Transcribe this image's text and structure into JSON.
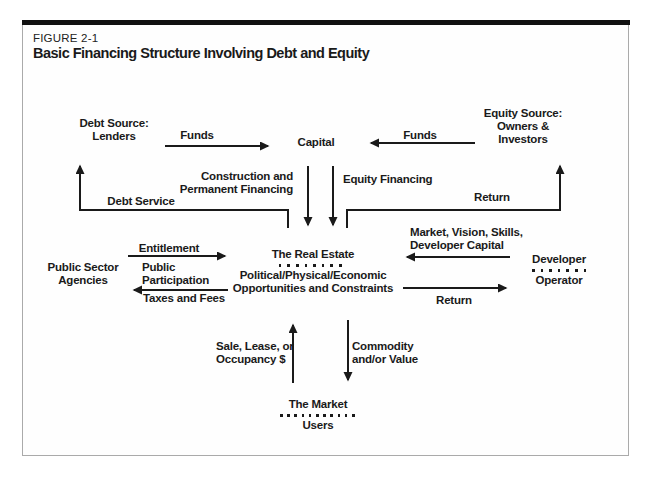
{
  "figure": {
    "label": "FIGURE 2-1",
    "title": "Basic Financing Structure Involving Debt and Equity"
  },
  "nodes": {
    "debt_source": {
      "line1": "Debt Source:",
      "line2": "Lenders"
    },
    "capital": {
      "label": "Capital"
    },
    "equity_source": {
      "line1": "Equity Source:",
      "line2": "Owners &",
      "line3": "Investors"
    },
    "real_estate": {
      "title": "The Real Estate",
      "sub1": "Political/Physical/Economic",
      "sub2": "Opportunities and Constraints"
    },
    "public_sector": {
      "line1": "Public Sector",
      "line2": "Agencies"
    },
    "developer_operator": {
      "line1": "Developer",
      "line2": "Operator"
    },
    "market": {
      "line1": "The Market",
      "line2": "Users"
    }
  },
  "flows": {
    "funds_left": {
      "label": "Funds"
    },
    "funds_right": {
      "label": "Funds"
    },
    "construction_financing": {
      "line1": "Construction and",
      "line2": "Permanent Financing"
    },
    "equity_financing": {
      "label": "Equity Financing"
    },
    "debt_service": {
      "label": "Debt Service"
    },
    "return_to_equity": {
      "label": "Return"
    },
    "entitlement": {
      "label": "Entitlement"
    },
    "public_participation": {
      "line1": "Public",
      "line2": "Participation"
    },
    "taxes_and_fees": {
      "label": "Taxes and Fees"
    },
    "market_vision": {
      "line1": "Market, Vision, Skills,",
      "line2": "Developer Capital"
    },
    "return_to_developer": {
      "label": "Return"
    },
    "sale_lease": {
      "line1": "Sale, Lease, or",
      "line2": "Occupancy $"
    },
    "commodity_value": {
      "line1": "Commodity",
      "line2": "and/or Value"
    }
  },
  "colors": {
    "ink": "#1a1a1a",
    "frame_border": "#aaaaaa",
    "top_rule": "#111111",
    "background": "#ffffff"
  }
}
